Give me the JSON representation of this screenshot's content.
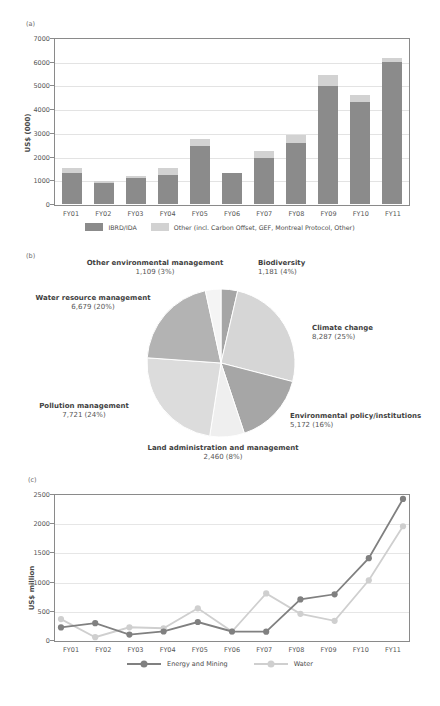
{
  "figure": {
    "panels": [
      {
        "tag": "(a)"
      },
      {
        "tag": "(b)"
      },
      {
        "tag": "(c)"
      }
    ]
  },
  "colors": {
    "dark_gray": "#8b8b8b",
    "light_gray": "#d2d2d2",
    "mid_gray": "#a6a6a6",
    "pale_gray": "#e8e8e8",
    "axis": "#8a8a8a",
    "grid": "#e3e3e3",
    "text": "#4a4a4a"
  },
  "chart_data": [
    {
      "id": "panel-a",
      "panel_tag": "(a)",
      "type": "bar",
      "stacked": true,
      "title": "",
      "xlabel": "",
      "ylabel": "US$ (000)",
      "ylim": [
        0,
        7000
      ],
      "ytick_step": 1000,
      "yticks": [
        0,
        1000,
        2000,
        3000,
        4000,
        5000,
        6000,
        7000
      ],
      "ytick_labels": [
        "0",
        "1000",
        "2000",
        "3000",
        "4000",
        "5000",
        "6000",
        "7000"
      ],
      "grid": true,
      "legend_position": "bottom",
      "categories": [
        "FY01",
        "FY02",
        "FY03",
        "FY04",
        "FY05",
        "FY06",
        "FY07",
        "FY08",
        "FY09",
        "FY10",
        "FY11"
      ],
      "series": [
        {
          "name": "IBRD/IDA",
          "color": "#8b8b8b",
          "values": [
            1310,
            890,
            1090,
            1240,
            2430,
            1300,
            1930,
            2560,
            4990,
            4290,
            5990
          ]
        },
        {
          "name": "Other (incl. Carbon Offset, GEF, Montreal Protocol, Other)",
          "color": "#d2d2d2",
          "values": [
            200,
            90,
            90,
            260,
            320,
            10,
            320,
            370,
            430,
            320,
            180
          ]
        }
      ]
    },
    {
      "id": "panel-b",
      "panel_tag": "(b)",
      "type": "pie",
      "title": "",
      "legend_position": "labels",
      "slices": [
        {
          "label": "Biodiversity",
          "value": 1181,
          "percent": 4,
          "value_text": "1,181 (4%)",
          "color": "#a6a6a6"
        },
        {
          "label": "Climate change",
          "value": 8287,
          "percent": 25,
          "value_text": "8,287 (25%)",
          "color": "#d6d6d6"
        },
        {
          "label": "Environmental policy/institutions",
          "value": 5172,
          "percent": 16,
          "value_text": "5,172 (16%)",
          "color": "#a6a6a6"
        },
        {
          "label": "Land administration and management",
          "value": 2460,
          "percent": 8,
          "value_text": "2,460 (8%)",
          "color": "#efefef"
        },
        {
          "label": "Pollution management",
          "value": 7721,
          "percent": 24,
          "value_text": "7,721 (24%)",
          "color": "#dcdcdc"
        },
        {
          "label": "Water resource management",
          "value": 6679,
          "percent": 20,
          "value_text": "6,679 (20%)",
          "color": "#b3b3b3"
        },
        {
          "label": "Other environmental management",
          "value": 1109,
          "percent": 3,
          "value_text": "1,109 (3%)",
          "color": "#f4f4f4"
        }
      ]
    },
    {
      "id": "panel-c",
      "panel_tag": "(c)",
      "type": "line",
      "title": "",
      "xlabel": "",
      "ylabel": "US$ million",
      "ylim": [
        0,
        2500
      ],
      "ytick_step": 500,
      "yticks": [
        0,
        500,
        1000,
        1500,
        2000,
        2500
      ],
      "ytick_labels": [
        "0",
        "500",
        "1000",
        "1500",
        "2000",
        "2500"
      ],
      "grid": true,
      "legend_position": "bottom",
      "categories": [
        "FY01",
        "FY02",
        "FY03",
        "FY04",
        "FY05",
        "FY06",
        "FY07",
        "FY08",
        "FY09",
        "FY10",
        "FY11"
      ],
      "series": [
        {
          "name": "Energy and Mining",
          "color": "#808080",
          "values": [
            232,
            305,
            110,
            163,
            325,
            163,
            160,
            712,
            800,
            1418,
            2432
          ]
        },
        {
          "name": "Water",
          "color": "#cfcfcf",
          "values": [
            375,
            65,
            235,
            218,
            560,
            163,
            815,
            465,
            345,
            1040,
            1965
          ]
        }
      ]
    }
  ]
}
